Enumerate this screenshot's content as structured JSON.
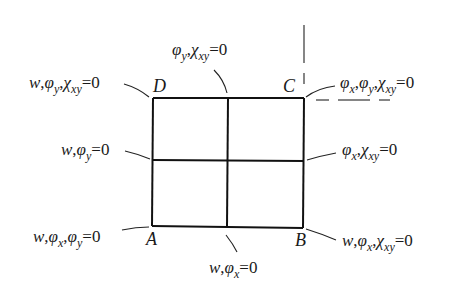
{
  "diagram": {
    "type": "plate boundary conditions",
    "corners": {
      "A": "A",
      "B": "B",
      "C": "C",
      "D": "D"
    },
    "labels": {
      "corner_D": {
        "parts": [
          "w",
          ",",
          "φ",
          "y",
          ",",
          "χ",
          "xy",
          "=0"
        ]
      },
      "top_mid": {
        "parts": [
          "φ",
          "y",
          ",",
          "χ",
          "xy",
          "=0"
        ]
      },
      "corner_C": {
        "parts": [
          "φ",
          "x",
          ",",
          "φ",
          "y",
          ",",
          "χ",
          "xy",
          "=0"
        ]
      },
      "left_mid": {
        "parts": [
          "w",
          ",",
          "φ",
          "y",
          "=0"
        ]
      },
      "right_mid": {
        "parts": [
          "φ",
          "x",
          ",",
          "χ",
          "xy",
          "=0"
        ]
      },
      "corner_A": {
        "parts": [
          "w",
          ",",
          "φ",
          "x",
          ",",
          "φ",
          "y",
          "=0"
        ]
      },
      "bottom_mid": {
        "parts": [
          "w",
          ",",
          "φ",
          "x",
          "=0"
        ]
      },
      "corner_B": {
        "parts": [
          "w",
          ",",
          "φ",
          "x",
          ",",
          "χ",
          "xy",
          "=0"
        ]
      }
    },
    "label_text": {
      "corner_D": "w,φy,χxy=0",
      "top_mid": "φy,χxy=0",
      "corner_C": "φx,φy,χxy=0",
      "left_mid": "w,φy=0",
      "right_mid": "φx,χxy=0",
      "corner_A": "w,φx,φy=0",
      "bottom_mid": "w,φx=0",
      "corner_B": "w,φx,χxy=0"
    },
    "colors": {
      "line": "#111111",
      "text": "#1a1a1a",
      "background": "#ffffff"
    }
  }
}
